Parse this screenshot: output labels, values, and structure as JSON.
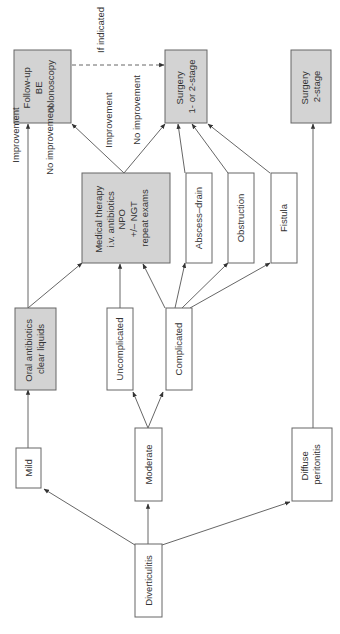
{
  "diagram": {
    "title": "",
    "orientation": "rotated 90deg counter-clockwise (text reads bottom-to-top)",
    "colors": {
      "shaded_box": "#d3d3d3",
      "plain_box": "#ffffff",
      "stroke": "#666666"
    },
    "nodes": {
      "diverticulitis": {
        "lines": [
          "Diverticulitis"
        ]
      },
      "mild": {
        "lines": [
          "Mild"
        ]
      },
      "moderate": {
        "lines": [
          "Moderate"
        ]
      },
      "diffuse": {
        "lines": [
          "Diffuse",
          "peritonitis"
        ]
      },
      "oral": {
        "lines": [
          "Oral antibiotics",
          "clear liquids"
        ]
      },
      "uncomplicated": {
        "lines": [
          "Uncomplicated"
        ]
      },
      "complicated": {
        "lines": [
          "Complicated"
        ]
      },
      "medical": {
        "lines": [
          "Medical therapy",
          "i.v. antibiotics",
          "NPO",
          "+/– NGT",
          "repeat exams"
        ]
      },
      "abscess": {
        "lines": [
          "Abscess–drain"
        ]
      },
      "obstruction": {
        "lines": [
          "Obstruction"
        ]
      },
      "fistula": {
        "lines": [
          "Fistula"
        ]
      },
      "followup": {
        "lines": [
          "Follow-up",
          "BE",
          "colonoscopy"
        ]
      },
      "surgery12": {
        "lines": [
          "Surgery",
          "1- or 2-stage"
        ]
      },
      "surgery2": {
        "lines": [
          "Surgery",
          "2-stage"
        ]
      }
    },
    "edge_labels": {
      "oral_to_followup": "Improvement",
      "oral_to_medical": "No improvement",
      "medical_to_followup": "Improvement",
      "medical_to_surgery": "No improvement",
      "followup_to_surgery": "If indicated"
    },
    "edges": [
      {
        "from": "Diverticulitis",
        "to": "Mild"
      },
      {
        "from": "Diverticulitis",
        "to": "Moderate"
      },
      {
        "from": "Diverticulitis",
        "to": "Diffuse peritonitis"
      },
      {
        "from": "Mild",
        "to": "Oral antibiotics clear liquids"
      },
      {
        "from": "Moderate",
        "to": "Uncomplicated"
      },
      {
        "from": "Moderate",
        "to": "Complicated"
      },
      {
        "from": "Oral antibiotics clear liquids",
        "to": "Follow-up BE colonoscopy",
        "label": "Improvement"
      },
      {
        "from": "Oral antibiotics clear liquids",
        "to": "Medical therapy",
        "label": "No improvement"
      },
      {
        "from": "Uncomplicated",
        "to": "Medical therapy"
      },
      {
        "from": "Complicated",
        "to": "Medical therapy"
      },
      {
        "from": "Complicated",
        "to": "Abscess–drain"
      },
      {
        "from": "Complicated",
        "to": "Obstruction"
      },
      {
        "from": "Complicated",
        "to": "Fistula"
      },
      {
        "from": "Medical therapy",
        "to": "Follow-up BE colonoscopy",
        "label": "Improvement"
      },
      {
        "from": "Medical therapy",
        "to": "Surgery 1- or 2-stage",
        "label": "No improvement"
      },
      {
        "from": "Abscess–drain",
        "to": "Surgery 1- or 2-stage"
      },
      {
        "from": "Obstruction",
        "to": "Surgery 1- or 2-stage"
      },
      {
        "from": "Fistula",
        "to": "Surgery 1- or 2-stage"
      },
      {
        "from": "Follow-up BE colonoscopy",
        "to": "Surgery 1- or 2-stage",
        "label": "If indicated",
        "style": "dashed"
      },
      {
        "from": "Diffuse peritonitis",
        "to": "Surgery 2-stage"
      }
    ]
  }
}
